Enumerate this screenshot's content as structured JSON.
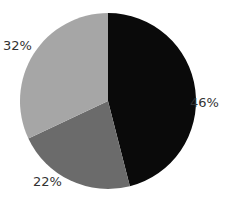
{
  "chart_data": {
    "type": "pie",
    "title": "",
    "categories": [
      "Slice A",
      "Slice B",
      "Slice C"
    ],
    "values": [
      46,
      22,
      32
    ],
    "labels": [
      "46%",
      "22%",
      "32%"
    ],
    "colors": [
      "#0a0a0a",
      "#6b6b6b",
      "#a6a6a6"
    ],
    "start_angle_deg": 0,
    "direction": "clockwise",
    "legend": "none"
  },
  "layout": {
    "center": [
      108,
      101
    ],
    "radius": 88,
    "label_positions": [
      [
        190,
        95
      ],
      [
        33,
        174
      ],
      [
        3,
        38
      ]
    ]
  }
}
